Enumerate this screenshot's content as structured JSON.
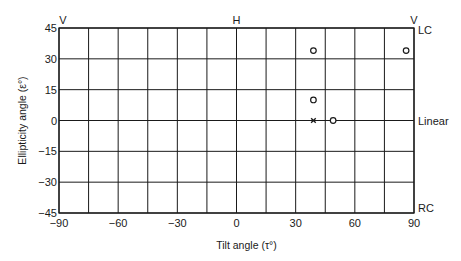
{
  "chart_data": {
    "type": "scatter",
    "title": "",
    "xlabel": "Tilt angle (τ°)",
    "ylabel": "Ellipticity angle (ε°)",
    "xlim": [
      -90,
      90
    ],
    "ylim": [
      -45,
      45
    ],
    "x_ticks": [
      -90,
      -60,
      -30,
      0,
      30,
      60,
      90
    ],
    "y_ticks": [
      45,
      30,
      15,
      0,
      -15,
      -30,
      -45
    ],
    "x_grid_step": 15,
    "y_grid_step": 15,
    "grid": true,
    "top_annotations": [
      {
        "text": "V",
        "x": -90
      },
      {
        "text": "H",
        "x": 0
      },
      {
        "text": "V",
        "x": 90
      }
    ],
    "right_annotations": [
      {
        "text": "LC",
        "y": 45
      },
      {
        "text": "Linear",
        "y": 0
      },
      {
        "text": "RC",
        "y": -45
      }
    ],
    "series": [
      {
        "name": "circle markers",
        "marker": "o",
        "points": [
          {
            "x": 39,
            "y": 34
          },
          {
            "x": 86,
            "y": 34
          },
          {
            "x": 39,
            "y": 10
          },
          {
            "x": 49,
            "y": 0
          }
        ]
      },
      {
        "name": "cross marker",
        "marker": "x",
        "points": [
          {
            "x": 39,
            "y": 0
          }
        ]
      }
    ]
  },
  "colors": {
    "grid": "#1a1a1a",
    "text": "#1a1a1a",
    "background": "#ffffff"
  }
}
